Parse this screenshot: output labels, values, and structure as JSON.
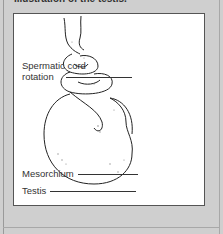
{
  "caption": "Illustration of the testis.",
  "figure": {
    "labels": [
      {
        "id": "spermatic-cord-rotation",
        "line1": "Spermatic cord",
        "line2": "rotation"
      },
      {
        "id": "mesorchium",
        "text": "Mesorchium"
      },
      {
        "id": "testis",
        "text": "Testis"
      }
    ]
  },
  "colors": {
    "background": "#cfcfcf",
    "panel": "#ffffff",
    "ink": "#333333"
  }
}
